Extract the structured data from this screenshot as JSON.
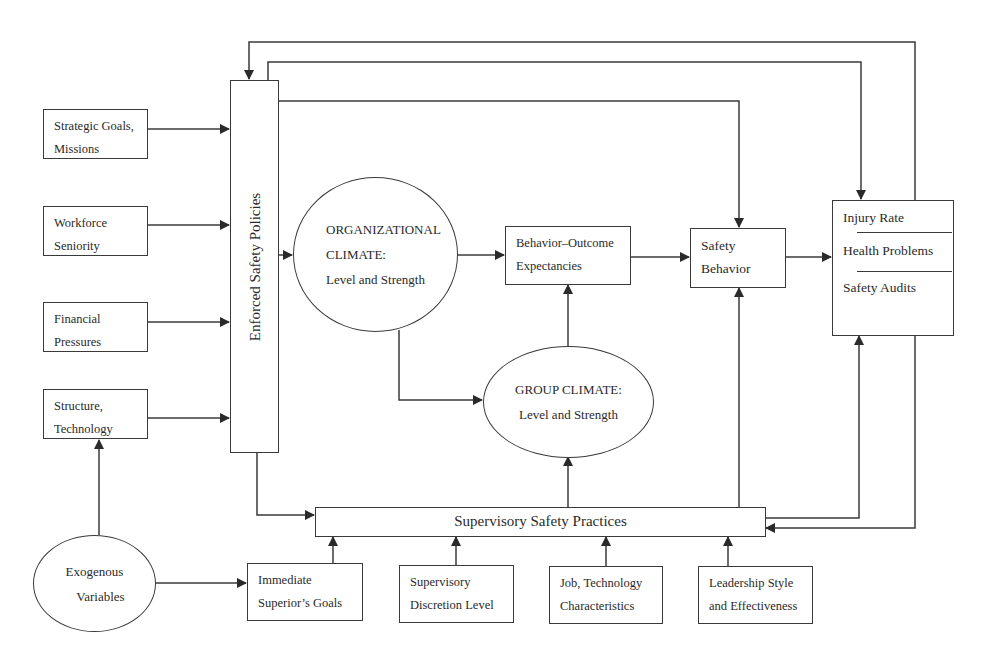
{
  "diagram": {
    "type": "safety-climate-model",
    "nodes": {
      "strategic_goals": {
        "line1": "Strategic Goals,",
        "line2": "Missions"
      },
      "workforce_seniority": {
        "line1": "Workforce",
        "line2": "Seniority"
      },
      "financial_pressures": {
        "line1": "Financial",
        "line2": "Pressures"
      },
      "structure_technology": {
        "line1": "Structure,",
        "line2": "Technology"
      },
      "enforced_safety_policies": {
        "label": "Enforced Safety  Policies"
      },
      "organizational_climate": {
        "line1": "ORGANIZATIONAL",
        "line2": "CLIMATE:",
        "line3": "Level and Strength"
      },
      "behavior_outcome": {
        "line1": "Behavior–Outcome",
        "line2": "Expectancies"
      },
      "safety_behavior": {
        "line1": "Safety",
        "line2": "Behavior"
      },
      "outcomes": {
        "item1": "Injury Rate",
        "item2": "Health Problems",
        "item3": "Safety Audits"
      },
      "group_climate": {
        "line1": "GROUP CLIMATE:",
        "line2": "Level and Strength"
      },
      "supervisory_practices": {
        "label": "Supervisory Safety Practices"
      },
      "exogenous_variables": {
        "line1": "Exogenous",
        "line2": "Variables"
      },
      "immediate_superior": {
        "line1": "Immediate",
        "line2": "Superior’s Goals"
      },
      "supervisory_discretion": {
        "line1": "Supervisory",
        "line2": "Discretion Level"
      },
      "job_technology": {
        "line1": "Job, Technology",
        "line2": "Characteristics"
      },
      "leadership_style": {
        "line1": "Leadership Style",
        "line2": "and Effectiveness"
      }
    },
    "edges": [
      [
        "Strategic Goals, Missions",
        "Enforced Safety Policies"
      ],
      [
        "Workforce Seniority",
        "Enforced Safety Policies"
      ],
      [
        "Financial Pressures",
        "Enforced Safety Policies"
      ],
      [
        "Structure, Technology",
        "Enforced Safety Policies"
      ],
      [
        "Exogenous Variables",
        "Structure, Technology"
      ],
      [
        "Exogenous Variables",
        "Immediate Superior's Goals"
      ],
      [
        "Enforced Safety Policies",
        "Organizational Climate"
      ],
      [
        "Enforced Safety Policies",
        "Safety Behavior"
      ],
      [
        "Enforced Safety Policies",
        "Outcomes"
      ],
      [
        "Enforced Safety Policies",
        "Supervisory Safety Practices"
      ],
      [
        "Organizational Climate",
        "Behavior-Outcome Expectancies"
      ],
      [
        "Organizational Climate",
        "Group Climate"
      ],
      [
        "Group Climate",
        "Behavior-Outcome Expectancies"
      ],
      [
        "Behavior-Outcome Expectancies",
        "Safety Behavior"
      ],
      [
        "Safety Behavior",
        "Outcomes"
      ],
      [
        "Supervisory Safety Practices",
        "Group Climate"
      ],
      [
        "Supervisory Safety Practices",
        "Safety Behavior"
      ],
      [
        "Supervisory Safety Practices",
        "Outcomes"
      ],
      [
        "Outcomes",
        "Supervisory Safety Practices"
      ],
      [
        "Outcomes",
        "Enforced Safety Policies"
      ],
      [
        "Immediate Superior's Goals",
        "Supervisory Safety Practices"
      ],
      [
        "Supervisory Discretion Level",
        "Supervisory Safety Practices"
      ],
      [
        "Job, Technology Characteristics",
        "Supervisory Safety Practices"
      ],
      [
        "Leadership Style and Effectiveness",
        "Supervisory Safety Practices"
      ]
    ],
    "colors": {
      "stroke": "#3a3a3a",
      "background": "#ffffff",
      "text": "#2a2a2a"
    }
  }
}
